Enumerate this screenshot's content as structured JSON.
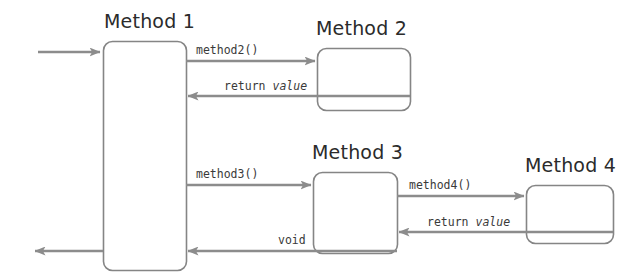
{
  "diagram": {
    "type": "sequence-call-diagram",
    "width": 641,
    "height": 276,
    "background_color": "#ffffff",
    "box_stroke_color": "#808080",
    "arrow_color": "#8c8c8c",
    "title_color": "#2b2b2b",
    "label_color": "#3a3a3a",
    "boxes": [
      {
        "id": "method1",
        "title": "Method 1",
        "x": 103,
        "y": 41,
        "width": 83,
        "height": 229
      },
      {
        "id": "method2",
        "title": "Method 2",
        "x": 317,
        "y": 48,
        "width": 93,
        "height": 62
      },
      {
        "id": "method3",
        "title": "Method 3",
        "x": 313,
        "y": 172,
        "width": 84,
        "height": 81
      },
      {
        "id": "method4",
        "title": "Method 4",
        "x": 526,
        "y": 185,
        "width": 87,
        "height": 58
      }
    ],
    "arrows": [
      {
        "id": "entry",
        "label": "",
        "label_italic": "",
        "from": "external",
        "to": "method1",
        "direction": "right",
        "x1": 38,
        "x2": 103,
        "y": 52
      },
      {
        "id": "call-method2",
        "label": "method2()",
        "label_italic": "",
        "from": "method1",
        "to": "method2",
        "direction": "right",
        "x1": 186,
        "x2": 317,
        "y": 61
      },
      {
        "id": "return-method2",
        "label": "return ",
        "label_italic": "value",
        "from": "method2",
        "to": "method1",
        "direction": "left",
        "x1": 186,
        "x2": 410,
        "y": 96
      },
      {
        "id": "call-method3",
        "label": "method3()",
        "label_italic": "",
        "from": "method1",
        "to": "method3",
        "direction": "right",
        "x1": 186,
        "x2": 313,
        "y": 185
      },
      {
        "id": "call-method4",
        "label": "method4()",
        "label_italic": "",
        "from": "method3",
        "to": "method4",
        "direction": "right",
        "x1": 397,
        "x2": 526,
        "y": 196
      },
      {
        "id": "return-method4",
        "label": "return ",
        "label_italic": "value",
        "from": "method4",
        "to": "method3",
        "direction": "left",
        "x1": 397,
        "x2": 613,
        "y": 232
      },
      {
        "id": "return-method3-void",
        "label": "void",
        "label_italic": "",
        "from": "method3",
        "to": "method1",
        "direction": "left",
        "x1": 186,
        "x2": 397,
        "y": 251
      },
      {
        "id": "exit",
        "label": "",
        "label_italic": "",
        "from": "method1",
        "to": "external",
        "direction": "left",
        "x1": 33,
        "x2": 103,
        "y": 251
      }
    ],
    "labels": {
      "method2_call": "method2()",
      "method2_return_keyword": "return ",
      "method2_return_value": "value",
      "method3_call": "method3()",
      "method3_return": "void",
      "method4_call": "method4()",
      "method4_return_keyword": "return ",
      "method4_return_value": "value"
    }
  }
}
